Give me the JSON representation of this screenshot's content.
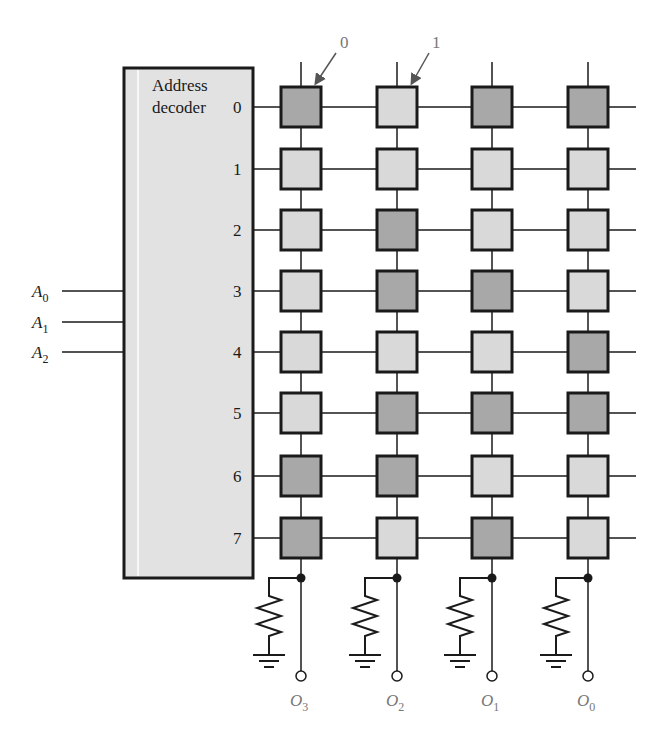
{
  "decoder": {
    "label_line1": "Address",
    "label_line2": "decoder",
    "inputs": [
      {
        "name": "A",
        "sub": "0"
      },
      {
        "name": "A",
        "sub": "1"
      },
      {
        "name": "A",
        "sub": "2"
      }
    ],
    "outputs": [
      "0",
      "1",
      "2",
      "3",
      "4",
      "5",
      "6",
      "7"
    ]
  },
  "annotations": [
    {
      "text": "0",
      "points_to": "dark cell (stores 0)"
    },
    {
      "text": "1",
      "points_to": "light cell (stores 1)"
    }
  ],
  "grid": {
    "rows": 8,
    "columns": 4,
    "legend": {
      "dark": "0",
      "light": "1"
    },
    "cells": [
      [
        "D",
        "L",
        "D",
        "D"
      ],
      [
        "L",
        "L",
        "L",
        "L"
      ],
      [
        "L",
        "D",
        "L",
        "L"
      ],
      [
        "L",
        "D",
        "D",
        "L"
      ],
      [
        "L",
        "L",
        "L",
        "D"
      ],
      [
        "L",
        "D",
        "D",
        "D"
      ],
      [
        "D",
        "D",
        "L",
        "L"
      ],
      [
        "D",
        "L",
        "D",
        "L"
      ]
    ]
  },
  "outputs": [
    {
      "name": "O",
      "sub": "3"
    },
    {
      "name": "O",
      "sub": "2"
    },
    {
      "name": "O",
      "sub": "1"
    },
    {
      "name": "O",
      "sub": "0"
    }
  ],
  "colors": {
    "dark_cell": "#a8a8a8",
    "light_cell": "#d9d9d9",
    "decoder_fill": "#e2e2e2",
    "stroke": "#1a1a1a"
  }
}
